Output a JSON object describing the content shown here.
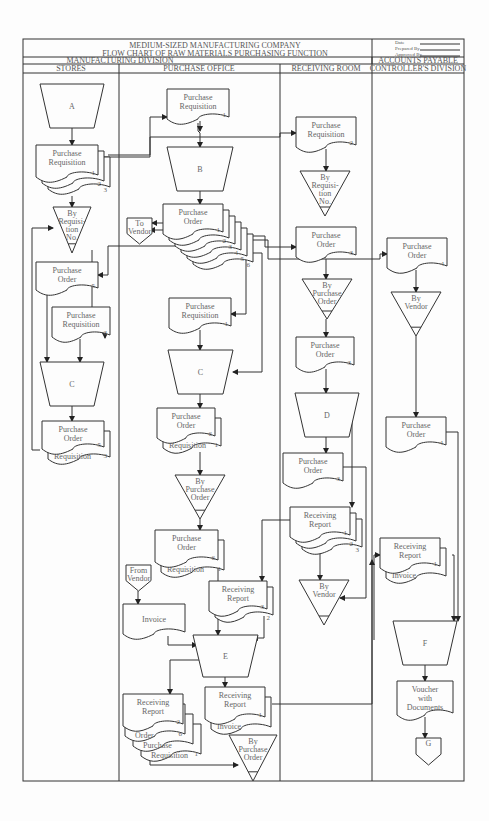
{
  "header": {
    "company": "MEDIUM-SIZED MANUFACTURING COMPANY",
    "title": "FLOW CHART OF RAW MATERIALS PURCHASING FUNCTION",
    "signoff": [
      "Date",
      "Prepared By",
      "Approved By"
    ]
  },
  "divisions": [
    {
      "label": "MANUFACTURING DIVISION",
      "x1": 23,
      "x2": 372
    },
    {
      "label": "ACCOUNTS PAYABLE",
      "x1": 372,
      "x2": 464
    }
  ],
  "columns": [
    {
      "label": "STORES",
      "x1": 23,
      "x2": 119
    },
    {
      "label": "PURCHASE OFFICE",
      "x1": 119,
      "x2": 280
    },
    {
      "label": "RECEIVING ROOM",
      "x1": 280,
      "x2": 372
    },
    {
      "label": "CONTROLLER'S DIVISION",
      "x1": 372,
      "x2": 464
    }
  ],
  "frame": {
    "left": 23,
    "right": 464,
    "top": 39,
    "title_bottom": 57,
    "div_bottom": 64,
    "col_bottom": 73,
    "bottom": 781
  },
  "nodes": [
    {
      "id": "A",
      "type": "manual",
      "x": 40,
      "y": 84,
      "w": 64,
      "h": 44,
      "lines": [
        "A"
      ]
    },
    {
      "id": "s_pr",
      "type": "doc",
      "x": 36,
      "y": 145,
      "w": 62,
      "h": 34,
      "lines": [
        "Purchase",
        "Requisition"
      ],
      "copies": [
        "1",
        "2",
        "3"
      ]
    },
    {
      "id": "s_file1",
      "type": "file",
      "x": 53,
      "y": 207,
      "w": 38,
      "h": 46,
      "lines": [
        "By",
        "Requisi-",
        "tion",
        "No."
      ]
    },
    {
      "id": "s_po5",
      "type": "doc",
      "x": 36,
      "y": 262,
      "w": 62,
      "h": 30,
      "lines": [
        "Purchase",
        "Order"
      ],
      "copies": [
        "5"
      ]
    },
    {
      "id": "s_pr3",
      "type": "doc",
      "x": 52,
      "y": 307,
      "w": 58,
      "h": 32,
      "lines": [
        "Purchase",
        "Requisition"
      ],
      "copies": [
        "3"
      ]
    },
    {
      "id": "s_C",
      "type": "manual",
      "x": 40,
      "y": 362,
      "w": 64,
      "h": 44,
      "lines": [
        "C"
      ]
    },
    {
      "id": "s_po5b",
      "type": "doc",
      "x": 42,
      "y": 421,
      "w": 62,
      "h": 30,
      "lines": [
        "Purchase",
        "Order"
      ],
      "copies": [
        "5"
      ],
      "attached": "Requisition",
      "attached_num": "3"
    },
    {
      "id": "p_pr1",
      "type": "doc",
      "x": 167,
      "y": 89,
      "w": 62,
      "h": 32,
      "lines": [
        "Purchase",
        "Requisition"
      ],
      "copies": [
        "1"
      ]
    },
    {
      "id": "B",
      "type": "manual",
      "x": 167,
      "y": 147,
      "w": 66,
      "h": 44,
      "lines": [
        "B"
      ]
    },
    {
      "id": "p_po",
      "type": "doc",
      "x": 163,
      "y": 204,
      "w": 60,
      "h": 32,
      "lines": [
        "Purchase",
        "Order"
      ],
      "copies": [
        "1",
        "2",
        "3",
        "4",
        "5",
        "6"
      ]
    },
    {
      "id": "to_vendor",
      "type": "offpage",
      "x": 127,
      "y": 218,
      "w": 25,
      "h": 26,
      "lines": [
        "To",
        "Vendor"
      ]
    },
    {
      "id": "p_pr1b",
      "type": "doc",
      "x": 169,
      "y": 298,
      "w": 62,
      "h": 32,
      "lines": [
        "Purchase",
        "Requisition"
      ],
      "copies": [
        "1"
      ]
    },
    {
      "id": "p_C",
      "type": "manual",
      "x": 168,
      "y": 350,
      "w": 65,
      "h": 44,
      "lines": [
        "C"
      ]
    },
    {
      "id": "p_po6",
      "type": "doc",
      "x": 157,
      "y": 408,
      "w": 58,
      "h": 32,
      "lines": [
        "Purchase",
        "Order"
      ],
      "copies": [
        "6"
      ],
      "attached": "Requisition",
      "attached_num": "1"
    },
    {
      "id": "p_file1",
      "type": "file",
      "x": 175,
      "y": 475,
      "w": 50,
      "h": 44,
      "lines": [
        "By",
        "Purchase",
        "Order"
      ]
    },
    {
      "id": "p_po6b",
      "type": "doc",
      "x": 155,
      "y": 530,
      "w": 63,
      "h": 34,
      "lines": [
        "Purchase",
        "Order"
      ],
      "copies": [
        "6"
      ],
      "attached": "Requisition",
      "attached_num": "1"
    },
    {
      "id": "from_vendor",
      "type": "offpage",
      "x": 126,
      "y": 565,
      "w": 25,
      "h": 26,
      "lines": [
        "From",
        "Vendor"
      ]
    },
    {
      "id": "p_invoice",
      "type": "doc",
      "x": 123,
      "y": 604,
      "w": 62,
      "h": 32,
      "lines": [
        "Invoice"
      ],
      "copies": []
    },
    {
      "id": "p_rr3",
      "type": "doc",
      "x": 209,
      "y": 581,
      "w": 58,
      "h": 32,
      "lines": [
        "Receiving",
        "Report"
      ],
      "copies": [
        "3",
        "2"
      ]
    },
    {
      "id": "E",
      "type": "manual",
      "x": 193,
      "y": 635,
      "w": 65,
      "h": 42,
      "lines": [
        "E"
      ]
    },
    {
      "id": "p_rr2",
      "type": "doc",
      "x": 123,
      "y": 694,
      "w": 60,
      "h": 34,
      "lines": [
        "Receiving",
        "Report"
      ],
      "copies": [
        "2"
      ],
      "stack": [
        [
          "Order",
          "6"
        ],
        [
          "Purchase",
          ""
        ],
        [
          "Requisition",
          "1"
        ]
      ]
    },
    {
      "id": "p_rr1",
      "type": "doc",
      "x": 205,
      "y": 687,
      "w": 60,
      "h": 34,
      "lines": [
        "Receiving",
        "Report"
      ],
      "copies": [
        "1"
      ],
      "attached": "Invoice",
      "attached_num": ""
    },
    {
      "id": "p_file2",
      "type": "file",
      "x": 229,
      "y": 735,
      "w": 48,
      "h": 46,
      "lines": [
        "By",
        "Purchase",
        "Order"
      ]
    },
    {
      "id": "r_pr2",
      "type": "doc",
      "x": 296,
      "y": 117,
      "w": 60,
      "h": 32,
      "lines": [
        "Purchase",
        "Requisition"
      ],
      "copies": [
        "2"
      ]
    },
    {
      "id": "r_file1",
      "type": "file",
      "x": 300,
      "y": 171,
      "w": 50,
      "h": 45,
      "lines": [
        "By",
        "Requisi-",
        "tion",
        "No."
      ]
    },
    {
      "id": "r_po3",
      "type": "doc",
      "x": 296,
      "y": 227,
      "w": 60,
      "h": 32,
      "lines": [
        "Purchase",
        "Order"
      ],
      "copies": [
        "3"
      ]
    },
    {
      "id": "r_file2",
      "type": "file",
      "x": 302,
      "y": 279,
      "w": 50,
      "h": 40,
      "lines": [
        "By",
        "Purchase",
        "Order"
      ]
    },
    {
      "id": "r_po3b",
      "type": "doc",
      "x": 296,
      "y": 337,
      "w": 58,
      "h": 32,
      "lines": [
        "Purchase",
        "Order"
      ],
      "copies": [
        "3"
      ]
    },
    {
      "id": "D",
      "type": "manual",
      "x": 295,
      "y": 393,
      "w": 64,
      "h": 44,
      "lines": [
        "D"
      ]
    },
    {
      "id": "r_po3c",
      "type": "doc",
      "x": 283,
      "y": 453,
      "w": 60,
      "h": 32,
      "lines": [
        "Purchase",
        "Order"
      ],
      "copies": [
        "3"
      ]
    },
    {
      "id": "r_rr",
      "type": "doc",
      "x": 290,
      "y": 507,
      "w": 60,
      "h": 32,
      "lines": [
        "Receiving",
        "Report"
      ],
      "copies": [
        "1",
        "2",
        "3"
      ]
    },
    {
      "id": "r_file3",
      "type": "file",
      "x": 299,
      "y": 580,
      "w": 50,
      "h": 45,
      "lines": [
        "By",
        "Vendor"
      ]
    },
    {
      "id": "c_po4",
      "type": "doc",
      "x": 387,
      "y": 238,
      "w": 60,
      "h": 32,
      "lines": [
        "Purchase",
        "Order"
      ],
      "copies": [
        "4"
      ]
    },
    {
      "id": "c_file",
      "type": "file",
      "x": 391,
      "y": 292,
      "w": 50,
      "h": 44,
      "lines": [
        "By",
        "Vendor"
      ]
    },
    {
      "id": "c_po4b",
      "type": "doc",
      "x": 386,
      "y": 417,
      "w": 60,
      "h": 32,
      "lines": [
        "Purchase",
        "Order"
      ],
      "copies": [
        "4"
      ]
    },
    {
      "id": "c_rr",
      "type": "doc",
      "x": 380,
      "y": 538,
      "w": 60,
      "h": 32,
      "lines": [
        "Receiving",
        "Report"
      ],
      "copies": [
        "1"
      ],
      "attached": "Invoice",
      "attached_num": ""
    },
    {
      "id": "F",
      "type": "manual",
      "x": 393,
      "y": 621,
      "w": 64,
      "h": 44,
      "lines": [
        "F"
      ]
    },
    {
      "id": "voucher",
      "type": "doc",
      "x": 397,
      "y": 681,
      "w": 56,
      "h": 36,
      "lines": [
        "Voucher",
        "with",
        "Documents"
      ],
      "copies": []
    },
    {
      "id": "G",
      "type": "offpage",
      "x": 416,
      "y": 738,
      "w": 25,
      "h": 27,
      "lines": [
        "G"
      ]
    }
  ],
  "edges": [
    [
      [
        72,
        128
      ],
      [
        72,
        145
      ]
    ],
    [
      [
        98,
        157
      ],
      [
        150,
        157
      ],
      [
        150,
        117
      ],
      [
        167,
        117
      ]
    ],
    [
      [
        108,
        155
      ],
      [
        150,
        155
      ],
      [
        150,
        137
      ],
      [
        280,
        137
      ],
      [
        280,
        133
      ],
      [
        296,
        133
      ]
    ],
    [
      [
        72,
        196
      ],
      [
        72,
        207
      ]
    ],
    [
      [
        198,
        123
      ],
      [
        198,
        131
      ],
      [
        200,
        133
      ],
      [
        200,
        147
      ]
    ],
    [
      [
        200,
        191
      ],
      [
        200,
        204
      ]
    ],
    [
      [
        163,
        223
      ],
      [
        152,
        223
      ]
    ],
    [
      [
        163,
        230
      ],
      [
        150,
        230
      ]
    ],
    [
      [
        185,
        246
      ],
      [
        108,
        246
      ],
      [
        108,
        275
      ],
      [
        98,
        275
      ]
    ],
    [
      [
        92,
        250
      ],
      [
        92,
        320
      ],
      [
        105,
        320
      ],
      [
        105,
        338
      ]
    ],
    [
      [
        228,
        236
      ],
      [
        265,
        236
      ],
      [
        265,
        247
      ],
      [
        296,
        247
      ]
    ],
    [
      [
        236,
        240
      ],
      [
        268,
        240
      ],
      [
        268,
        259
      ],
      [
        380,
        259
      ],
      [
        380,
        254
      ],
      [
        387,
        254
      ]
    ],
    [
      [
        240,
        248
      ],
      [
        246,
        248
      ],
      [
        246,
        314
      ],
      [
        231,
        314
      ]
    ],
    [
      [
        244,
        253
      ],
      [
        262,
        253
      ],
      [
        262,
        372
      ],
      [
        233,
        372
      ]
    ],
    [
      [
        47,
        292
      ],
      [
        47,
        362
      ]
    ],
    [
      [
        80,
        339
      ],
      [
        80,
        362
      ]
    ],
    [
      [
        72,
        406
      ],
      [
        72,
        421
      ]
    ],
    [
      [
        200,
        121
      ],
      [
        200,
        131
      ]
    ],
    [
      [
        200,
        330
      ],
      [
        200,
        350
      ]
    ],
    [
      [
        200,
        394
      ],
      [
        200,
        408
      ]
    ],
    [
      [
        200,
        452
      ],
      [
        200,
        475
      ]
    ],
    [
      [
        200,
        519
      ],
      [
        200,
        530
      ]
    ],
    [
      [
        40,
        450
      ],
      [
        32,
        450
      ],
      [
        32,
        228
      ],
      [
        53,
        228
      ]
    ],
    [
      [
        326,
        149
      ],
      [
        326,
        171
      ]
    ],
    [
      [
        326,
        259
      ],
      [
        326,
        279
      ]
    ],
    [
      [
        326,
        319
      ],
      [
        326,
        337
      ]
    ],
    [
      [
        326,
        369
      ],
      [
        326,
        393
      ]
    ],
    [
      [
        326,
        437
      ],
      [
        326,
        453
      ]
    ],
    [
      [
        343,
        467
      ],
      [
        366,
        467
      ],
      [
        366,
        598
      ],
      [
        340,
        598
      ]
    ],
    [
      [
        352,
        400
      ],
      [
        352,
        507
      ]
    ],
    [
      [
        320,
        539
      ],
      [
        320,
        580
      ]
    ],
    [
      [
        290,
        520
      ],
      [
        262,
        520
      ],
      [
        262,
        581
      ]
    ],
    [
      [
        416,
        270
      ],
      [
        416,
        292
      ]
    ],
    [
      [
        416,
        336
      ],
      [
        416,
        417
      ]
    ],
    [
      [
        446,
        432
      ],
      [
        458,
        432
      ],
      [
        458,
        621
      ]
    ],
    [
      [
        452,
        555
      ],
      [
        454,
        555
      ],
      [
        454,
        621
      ]
    ],
    [
      [
        374,
        640
      ],
      [
        374,
        555
      ],
      [
        380,
        555
      ]
    ],
    [
      [
        425,
        665
      ],
      [
        425,
        681
      ]
    ],
    [
      [
        425,
        717
      ],
      [
        425,
        738
      ]
    ],
    [
      [
        138,
        591
      ],
      [
        138,
        604
      ]
    ],
    [
      [
        168,
        636
      ],
      [
        168,
        645
      ],
      [
        197,
        645
      ]
    ],
    [
      [
        218,
        564
      ],
      [
        218,
        635
      ]
    ],
    [
      [
        264,
        616
      ],
      [
        264,
        638
      ],
      [
        253,
        638
      ]
    ],
    [
      [
        200,
        660
      ],
      [
        170,
        660
      ],
      [
        170,
        694
      ]
    ],
    [
      [
        225,
        677
      ],
      [
        225,
        687
      ]
    ],
    [
      [
        272,
        704
      ],
      [
        372,
        704
      ],
      [
        372,
        560
      ]
    ],
    [
      [
        150,
        760
      ],
      [
        150,
        765
      ],
      [
        238,
        765
      ]
    ]
  ]
}
